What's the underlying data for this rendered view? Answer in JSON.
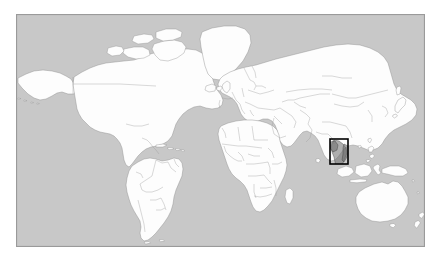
{
  "figure": {
    "kind": "world-locator-map",
    "projection": "equirectangular",
    "frame": {
      "x": 16,
      "y": 14,
      "width": 409,
      "height": 233
    },
    "colors": {
      "page_background": "#ffffff",
      "ocean": "#c8c8c8",
      "land": "#fdfdfd",
      "country_border": "#8c8c8c",
      "coastline": "#6e6e6e",
      "frame_border": "#9a9a9a",
      "highlight_outline": "#000000",
      "highlight_fill": "#6e6e6e"
    },
    "lon_range": [
      -180,
      180
    ],
    "lat_range": [
      -58,
      84
    ]
  },
  "highlight": {
    "label": "Southeast Asia locator box",
    "region_name": "Indochina / Southeast Asia",
    "box_px": {
      "x": 330,
      "y": 139,
      "width": 18,
      "height": 25
    },
    "box_lonlat": {
      "west": 95.5,
      "east": 111.5,
      "north": 24.0,
      "south": -2.0
    },
    "stroke_width": 1.6
  },
  "landmasses": [
    {
      "name": "North America"
    },
    {
      "name": "Greenland"
    },
    {
      "name": "South America"
    },
    {
      "name": "Europe"
    },
    {
      "name": "Africa"
    },
    {
      "name": "Asia"
    },
    {
      "name": "Australia"
    },
    {
      "name": "New Zealand"
    },
    {
      "name": "Indonesia / Maritime Southeast Asia"
    },
    {
      "name": "Japan"
    },
    {
      "name": "Madagascar"
    },
    {
      "name": "Iceland"
    },
    {
      "name": "British Isles"
    },
    {
      "name": "Caribbean islands"
    },
    {
      "name": "Philippines"
    },
    {
      "name": "Sri Lanka"
    },
    {
      "name": "New Guinea"
    }
  ],
  "labels": {
    "none_visible": ""
  }
}
